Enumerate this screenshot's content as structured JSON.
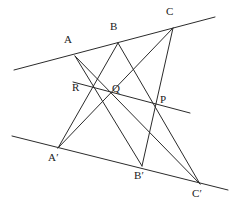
{
  "figure": {
    "name": "pappus-hexagon-theorem-figure",
    "width": 241,
    "height": 205,
    "background_color": "#ffffff",
    "stroke_color": "#2b2b2b",
    "stroke_width": 1,
    "label_color": "#1a1a1a"
  },
  "points": [
    {
      "id": "A",
      "label": "A",
      "x": 75,
      "y": 56,
      "label_x": 64,
      "label_y": 34
    },
    {
      "id": "B",
      "label": "B",
      "x": 118,
      "y": 43,
      "label_x": 110,
      "label_y": 21
    },
    {
      "id": "C",
      "label": "C",
      "x": 173,
      "y": 28,
      "label_x": 166,
      "label_y": 6
    },
    {
      "id": "R",
      "label": "R",
      "x": 92,
      "y": 88,
      "label_x": 72,
      "label_y": 82
    },
    {
      "id": "Q",
      "label": "Q",
      "x": 110,
      "y": 92,
      "label_x": 112,
      "label_y": 83
    },
    {
      "id": "P",
      "label": "P",
      "x": 156,
      "y": 104,
      "label_x": 160,
      "label_y": 94
    },
    {
      "id": "A1",
      "label": "A′",
      "x": 58,
      "y": 148,
      "label_x": 48,
      "label_y": 152
    },
    {
      "id": "B1",
      "label": "B′",
      "x": 142,
      "y": 166,
      "label_x": 134,
      "label_y": 170
    },
    {
      "id": "C1",
      "label": "C′",
      "x": 200,
      "y": 184,
      "label_x": 192,
      "label_y": 188
    }
  ],
  "lines": [
    {
      "id": "top-line",
      "name": "line-through-A-B-C",
      "x1": 14,
      "y1": 70,
      "x2": 215,
      "y2": 17
    },
    {
      "id": "pappus-line",
      "name": "pappus-line-R-Q-P",
      "x1": 73,
      "y1": 82,
      "x2": 190,
      "y2": 113
    },
    {
      "id": "bottom-line",
      "name": "line-through-Aprime-Bprime-Cprime",
      "x1": 12,
      "y1": 136,
      "x2": 228,
      "y2": 190
    },
    {
      "id": "seg-A-B1",
      "name": "segment-A-Bprime",
      "x1": 75,
      "y1": 56,
      "x2": 142,
      "y2": 166
    },
    {
      "id": "seg-A-C1",
      "name": "segment-A-Cprime",
      "x1": 75,
      "y1": 56,
      "x2": 200,
      "y2": 184
    },
    {
      "id": "seg-B-A1",
      "name": "segment-B-Aprime",
      "x1": 118,
      "y1": 43,
      "x2": 58,
      "y2": 148
    },
    {
      "id": "seg-B-C1",
      "name": "segment-B-Cprime",
      "x1": 118,
      "y1": 43,
      "x2": 200,
      "y2": 184
    },
    {
      "id": "seg-C-A1",
      "name": "segment-C-Aprime",
      "x1": 173,
      "y1": 28,
      "x2": 58,
      "y2": 148
    },
    {
      "id": "seg-C-B1",
      "name": "segment-C-Bprime",
      "x1": 173,
      "y1": 28,
      "x2": 142,
      "y2": 166
    }
  ]
}
